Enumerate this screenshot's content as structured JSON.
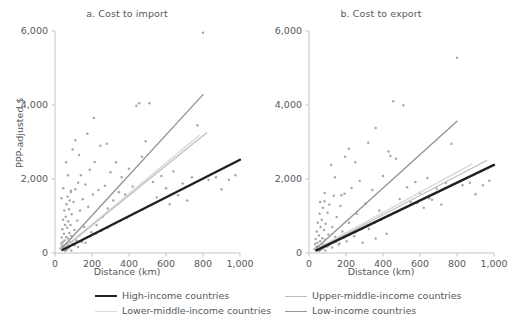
{
  "chart_data": [
    {
      "type": "scatter",
      "panel_id": "a",
      "title": "a. Cost to import",
      "xlabel": "Distance (km)",
      "ylabel": "PPP-adjusted $",
      "xlim": [
        0,
        1000
      ],
      "ylim": [
        0,
        6000
      ],
      "xticks": [
        0,
        200,
        400,
        600,
        800,
        1000
      ],
      "xticklabels": [
        "0",
        "200",
        "400",
        "600",
        "800",
        "1,000"
      ],
      "yticks": [
        0,
        2000,
        4000,
        6000
      ],
      "yticklabels": [
        "0",
        "2,000",
        "4,000",
        "6,000"
      ],
      "grid": false,
      "point_color": "#a7a9ac",
      "points": [
        [
          30,
          120
        ],
        [
          34,
          260
        ],
        [
          36,
          420
        ],
        [
          38,
          180
        ],
        [
          40,
          640
        ],
        [
          42,
          300
        ],
        [
          44,
          900
        ],
        [
          46,
          200
        ],
        [
          48,
          520
        ],
        [
          50,
          1150
        ],
        [
          52,
          340
        ],
        [
          54,
          760
        ],
        [
          56,
          150
        ],
        [
          58,
          980
        ],
        [
          60,
          430
        ],
        [
          62,
          1320
        ],
        [
          64,
          250
        ],
        [
          66,
          680
        ],
        [
          68,
          1520
        ],
        [
          70,
          390
        ],
        [
          72,
          860
        ],
        [
          74,
          180
        ],
        [
          76,
          1180
        ],
        [
          78,
          540
        ],
        [
          80,
          1420
        ],
        [
          82,
          300
        ],
        [
          84,
          760
        ],
        [
          86,
          1680
        ],
        [
          88,
          460
        ],
        [
          90,
          1050
        ],
        [
          95,
          250
        ],
        [
          100,
          1380
        ],
        [
          105,
          620
        ],
        [
          110,
          1720
        ],
        [
          115,
          340
        ],
        [
          120,
          880
        ],
        [
          125,
          1900
        ],
        [
          130,
          480
        ],
        [
          135,
          1150
        ],
        [
          140,
          2100
        ],
        [
          145,
          300
        ],
        [
          150,
          1450
        ],
        [
          158,
          700
        ],
        [
          165,
          1850
        ],
        [
          172,
          420
        ],
        [
          180,
          1250
        ],
        [
          188,
          2250
        ],
        [
          196,
          560
        ],
        [
          205,
          1580
        ],
        [
          215,
          2460
        ],
        [
          225,
          760
        ],
        [
          235,
          1700
        ],
        [
          245,
          2900
        ],
        [
          258,
          980
        ],
        [
          270,
          1820
        ],
        [
          285,
          1200
        ],
        [
          300,
          2180
        ],
        [
          315,
          1420
        ],
        [
          330,
          2450
        ],
        [
          345,
          1640
        ],
        [
          360,
          2050
        ],
        [
          380,
          1580
        ],
        [
          400,
          2280
        ],
        [
          420,
          1800
        ],
        [
          440,
          3980
        ],
        [
          455,
          4050
        ],
        [
          470,
          2600
        ],
        [
          490,
          3020
        ],
        [
          510,
          4050
        ],
        [
          530,
          1920
        ],
        [
          550,
          1500
        ],
        [
          575,
          2080
        ],
        [
          600,
          1750
        ],
        [
          620,
          1320
        ],
        [
          640,
          2200
        ],
        [
          665,
          1560
        ],
        [
          690,
          1880
        ],
        [
          715,
          1420
        ],
        [
          740,
          2050
        ],
        [
          770,
          3450
        ],
        [
          800,
          5950
        ],
        [
          830,
          1980
        ],
        [
          870,
          2050
        ],
        [
          900,
          1720
        ],
        [
          940,
          1980
        ],
        [
          975,
          2100
        ],
        [
          60,
          2450
        ],
        [
          70,
          2100
        ],
        [
          85,
          1650
        ],
        [
          95,
          2800
        ],
        [
          110,
          3050
        ],
        [
          130,
          2650
        ],
        [
          175,
          3220
        ],
        [
          210,
          3650
        ],
        [
          280,
          2950
        ],
        [
          35,
          1480
        ],
        [
          45,
          1750
        ],
        [
          55,
          60
        ],
        [
          65,
          90
        ],
        [
          75,
          140
        ],
        [
          88,
          70
        ],
        [
          105,
          210
        ],
        [
          125,
          160
        ],
        [
          145,
          320
        ],
        [
          165,
          280
        ],
        [
          190,
          450
        ],
        [
          220,
          520
        ],
        [
          250,
          600
        ],
        [
          285,
          680
        ],
        [
          320,
          790
        ],
        [
          355,
          880
        ],
        [
          390,
          960
        ],
        [
          430,
          1080
        ],
        [
          475,
          1180
        ],
        [
          520,
          1300
        ]
      ],
      "series": [
        {
          "name": "High-income countries",
          "type": "trendline",
          "color": "#231f20",
          "width": 2.4,
          "x": [
            40,
            1000
          ],
          "y": [
            80,
            2520
          ]
        },
        {
          "name": "Upper-middle-income countries",
          "type": "trendline",
          "color": "#bcbec0",
          "width": 1.2,
          "x": [
            40,
            820
          ],
          "y": [
            100,
            3250
          ]
        },
        {
          "name": "Lower-middle-income countries",
          "type": "trendline",
          "color": "#d9dadb",
          "width": 1.4,
          "x": [
            40,
            780
          ],
          "y": [
            110,
            3180
          ]
        },
        {
          "name": "Low-income countries",
          "type": "trendline",
          "color": "#939598",
          "width": 1.4,
          "x": [
            40,
            800
          ],
          "y": [
            140,
            4280
          ]
        }
      ]
    },
    {
      "type": "scatter",
      "panel_id": "b",
      "title": "b. Cost to export",
      "xlabel": "Distance (km)",
      "ylabel": "PPP-adjusted $",
      "xlim": [
        0,
        1000
      ],
      "ylim": [
        0,
        6000
      ],
      "xticks": [
        0,
        200,
        400,
        600,
        800,
        1000
      ],
      "xticklabels": [
        "0",
        "200",
        "400",
        "600",
        "800",
        "1,000"
      ],
      "yticks": [
        0,
        2000,
        4000,
        6000
      ],
      "yticklabels": [
        "0",
        "2,000",
        "4,000",
        "6,000"
      ],
      "grid": false,
      "point_color": "#a7a9ac",
      "points": [
        [
          30,
          100
        ],
        [
          33,
          240
        ],
        [
          36,
          380
        ],
        [
          39,
          160
        ],
        [
          42,
          580
        ],
        [
          45,
          280
        ],
        [
          48,
          820
        ],
        [
          51,
          190
        ],
        [
          54,
          470
        ],
        [
          57,
          1060
        ],
        [
          60,
          320
        ],
        [
          63,
          700
        ],
        [
          66,
          140
        ],
        [
          69,
          900
        ],
        [
          72,
          400
        ],
        [
          75,
          1220
        ],
        [
          78,
          230
        ],
        [
          81,
          620
        ],
        [
          84,
          1400
        ],
        [
          87,
          360
        ],
        [
          90,
          790
        ],
        [
          95,
          170
        ],
        [
          100,
          1090
        ],
        [
          105,
          500
        ],
        [
          110,
          1310
        ],
        [
          118,
          280
        ],
        [
          126,
          700
        ],
        [
          134,
          1550
        ],
        [
          142,
          430
        ],
        [
          150,
          970
        ],
        [
          160,
          230
        ],
        [
          170,
          1270
        ],
        [
          180,
          580
        ],
        [
          192,
          1600
        ],
        [
          204,
          320
        ],
        [
          216,
          820
        ],
        [
          230,
          1760
        ],
        [
          244,
          450
        ],
        [
          258,
          1060
        ],
        [
          274,
          1950
        ],
        [
          290,
          280
        ],
        [
          306,
          1340
        ],
        [
          324,
          650
        ],
        [
          342,
          1700
        ],
        [
          360,
          390
        ],
        [
          380,
          1150
        ],
        [
          400,
          2080
        ],
        [
          420,
          520
        ],
        [
          440,
          2620
        ],
        [
          455,
          4100
        ],
        [
          470,
          2550
        ],
        [
          490,
          1460
        ],
        [
          510,
          3990
        ],
        [
          530,
          1780
        ],
        [
          550,
          1380
        ],
        [
          575,
          1920
        ],
        [
          600,
          1620
        ],
        [
          620,
          1220
        ],
        [
          640,
          2030
        ],
        [
          665,
          1440
        ],
        [
          690,
          1740
        ],
        [
          715,
          1310
        ],
        [
          740,
          1890
        ],
        [
          770,
          2950
        ],
        [
          800,
          5280
        ],
        [
          830,
          1830
        ],
        [
          870,
          1900
        ],
        [
          900,
          1590
        ],
        [
          940,
          1830
        ],
        [
          975,
          1950
        ],
        [
          120,
          2380
        ],
        [
          140,
          2050
        ],
        [
          175,
          1560
        ],
        [
          195,
          2600
        ],
        [
          215,
          2820
        ],
        [
          250,
          2450
        ],
        [
          320,
          2980
        ],
        [
          360,
          3380
        ],
        [
          430,
          2740
        ],
        [
          60,
          1380
        ],
        [
          85,
          1620
        ],
        [
          55,
          55
        ],
        [
          65,
          85
        ],
        [
          75,
          130
        ],
        [
          88,
          65
        ],
        [
          105,
          195
        ],
        [
          125,
          150
        ],
        [
          145,
          300
        ],
        [
          165,
          260
        ],
        [
          190,
          420
        ],
        [
          220,
          490
        ],
        [
          250,
          560
        ],
        [
          285,
          640
        ],
        [
          320,
          740
        ],
        [
          355,
          820
        ],
        [
          390,
          900
        ],
        [
          430,
          1010
        ],
        [
          475,
          1110
        ],
        [
          520,
          1220
        ],
        [
          585,
          1350
        ],
        [
          650,
          1480
        ]
      ],
      "series": [
        {
          "name": "High-income countries",
          "type": "trendline",
          "color": "#231f20",
          "width": 2.4,
          "x": [
            40,
            1000
          ],
          "y": [
            70,
            2380
          ]
        },
        {
          "name": "Upper-middle-income countries",
          "type": "trendline",
          "color": "#bcbec0",
          "width": 1.2,
          "x": [
            40,
            960
          ],
          "y": [
            90,
            2500
          ]
        },
        {
          "name": "Lower-middle-income countries",
          "type": "trendline",
          "color": "#d9dadb",
          "width": 1.4,
          "x": [
            40,
            880
          ],
          "y": [
            110,
            2400
          ]
        },
        {
          "name": "Low-income countries",
          "type": "trendline",
          "color": "#939598",
          "width": 1.4,
          "x": [
            40,
            800
          ],
          "y": [
            130,
            3560
          ]
        }
      ]
    }
  ],
  "legend": {
    "position": "bottom",
    "items": [
      {
        "label": "High-income countries",
        "color": "#231f20",
        "width": 2.4
      },
      {
        "label": "Upper-middle-income countries",
        "color": "#bcbec0",
        "width": 1.2
      },
      {
        "label": "Lower-middle-income countries",
        "color": "#d9dadb",
        "width": 1.4
      },
      {
        "label": "Low-income countries",
        "color": "#939598",
        "width": 1.6
      }
    ]
  },
  "style": {
    "axis_color": "#bcbec0",
    "text_color": "#58595b",
    "background": "#ffffff"
  }
}
